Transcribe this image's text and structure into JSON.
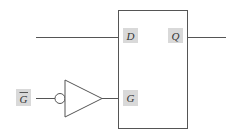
{
  "diagram": {
    "type": "gated-d-latch-symbol",
    "colors": {
      "line": "#555555",
      "label_bg": "#d9d9d9",
      "text": "#333333",
      "background": "#ffffff"
    },
    "labels": {
      "d_input": "D",
      "q_output": "Q",
      "g_input": "G",
      "g_bar": "G"
    },
    "g_bar_overline": true,
    "components": [
      "latch-box",
      "inverter-buffer-with-bubble"
    ]
  }
}
